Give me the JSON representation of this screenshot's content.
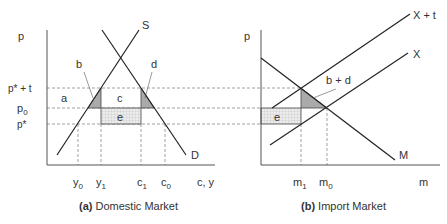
{
  "panel_a": {
    "caption_bold": "(a)",
    "caption": " Domestic Market",
    "y_axis_label": "p",
    "x_axis_label": "c, y",
    "price_labels": {
      "p_star_t": "p* + t",
      "p0_base": "p",
      "p0_sub": "0",
      "p_star": "p*"
    },
    "qty_labels": [
      {
        "base": "y",
        "sub": "0"
      },
      {
        "base": "y",
        "sub": "1"
      },
      {
        "base": "c",
        "sub": "1"
      },
      {
        "base": "c",
        "sub": "0"
      }
    ],
    "curves": {
      "supply": "S",
      "demand": "D"
    },
    "areas": {
      "a": "a",
      "b": "b",
      "c": "c",
      "d": "d",
      "e": "e"
    }
  },
  "panel_b": {
    "caption_bold": "(b)",
    "caption": " Import Market",
    "y_axis_label": "p",
    "x_axis_label": "m",
    "qty_labels": [
      {
        "base": "m",
        "sub": "1"
      },
      {
        "base": "m",
        "sub": "0"
      }
    ],
    "curves": {
      "export_tariff": "X + t",
      "export": "X",
      "import_demand": "M"
    },
    "areas": {
      "bd": "b + d",
      "e": "e"
    }
  },
  "colors": {
    "line": "#222222",
    "dashed": "#777777",
    "shade": "#aaaaaa",
    "grid_fill": "#e6e6e6",
    "grid_line": "#bbbbbb"
  }
}
